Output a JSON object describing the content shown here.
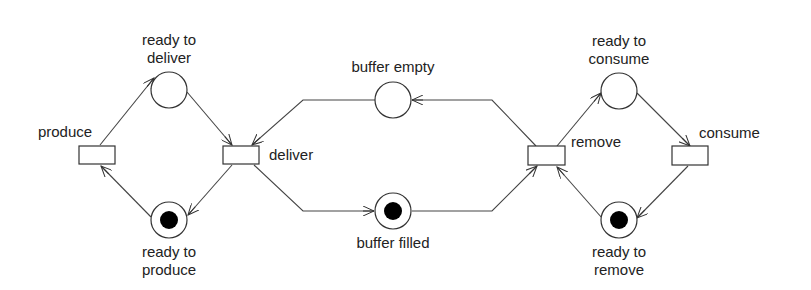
{
  "places": [
    {
      "id": "ready_to_deliver",
      "label": [
        "ready to",
        "deliver"
      ],
      "tokens": 0
    },
    {
      "id": "ready_to_produce",
      "label": [
        "ready to",
        "produce"
      ],
      "tokens": 1
    },
    {
      "id": "buffer_empty",
      "label": [
        "buffer empty"
      ],
      "tokens": 0
    },
    {
      "id": "buffer_filled",
      "label": [
        "buffer filled"
      ],
      "tokens": 1
    },
    {
      "id": "ready_to_consume",
      "label": [
        "ready to",
        "consume"
      ],
      "tokens": 0
    },
    {
      "id": "ready_to_remove",
      "label": [
        "ready to",
        "remove"
      ],
      "tokens": 1
    }
  ],
  "transitions": [
    {
      "id": "produce",
      "label": "produce"
    },
    {
      "id": "deliver",
      "label": "deliver"
    },
    {
      "id": "remove",
      "label": "remove"
    },
    {
      "id": "consume",
      "label": "consume"
    }
  ],
  "arcs": [
    {
      "from": "produce",
      "to": "ready_to_deliver"
    },
    {
      "from": "ready_to_deliver",
      "to": "deliver"
    },
    {
      "from": "deliver",
      "to": "ready_to_produce"
    },
    {
      "from": "ready_to_produce",
      "to": "produce"
    },
    {
      "from": "buffer_empty",
      "to": "deliver"
    },
    {
      "from": "deliver",
      "to": "buffer_filled"
    },
    {
      "from": "buffer_filled",
      "to": "remove"
    },
    {
      "from": "remove",
      "to": "buffer_empty"
    },
    {
      "from": "remove",
      "to": "ready_to_consume"
    },
    {
      "from": "ready_to_consume",
      "to": "consume"
    },
    {
      "from": "consume",
      "to": "ready_to_remove"
    },
    {
      "from": "ready_to_remove",
      "to": "remove"
    }
  ]
}
